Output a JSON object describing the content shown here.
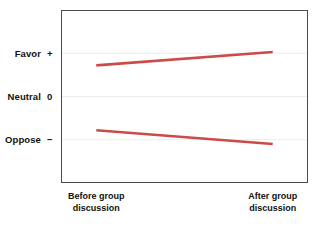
{
  "chart_data": {
    "type": "line",
    "title": "",
    "subtitle": "",
    "xlabel": "",
    "ylabel": "",
    "grid": true,
    "legend": false,
    "legend_position": "none",
    "categories": [
      "Before group discussion",
      "After group discussion"
    ],
    "x": [
      0,
      1
    ],
    "xlim": [
      -0.2,
      1.2
    ],
    "ylim": [
      -2,
      2
    ],
    "ytick_values": [
      1,
      0,
      -1
    ],
    "ytick_labels": [
      "Favor +",
      "Neutral 0",
      "Oppose −"
    ],
    "series": [
      {
        "name": "Initially favorable group",
        "color": "#cc4a48",
        "values": [
          0.72,
          1.03
        ]
      },
      {
        "name": "Initially opposed group",
        "color": "#cc4a48",
        "values": [
          -0.78,
          -1.1
        ]
      }
    ],
    "annotations": []
  },
  "axes": {
    "y": {
      "ticks": [
        {
          "label": "Favor",
          "symbol": "+"
        },
        {
          "label": "Neutral",
          "symbol": "0"
        },
        {
          "label": "Oppose",
          "symbol": "−"
        }
      ]
    },
    "x": {
      "ticks": [
        {
          "line1": "Before group",
          "line2": "discussion"
        },
        {
          "line1": "After group",
          "line2": "discussion"
        }
      ]
    }
  },
  "style": {
    "line_color": "#cc4a48",
    "frame_color": "#4b4b4b",
    "grid_color": "#ededed",
    "text_color": "#111111",
    "background": "#ffffff"
  }
}
